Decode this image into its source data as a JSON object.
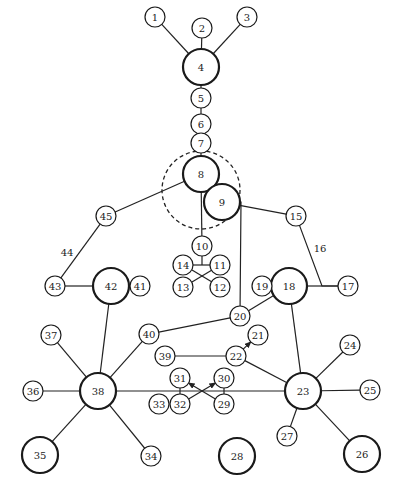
{
  "diagram": {
    "type": "network-graph",
    "colors": {
      "stroke": "#1a1a1a",
      "fill": "#ffffff",
      "text": "#222222"
    },
    "nodes": [
      {
        "id": "1",
        "x": 155,
        "y": 17,
        "r": 10,
        "w": 1.2
      },
      {
        "id": "2",
        "x": 202,
        "y": 28,
        "r": 10,
        "w": 1.2
      },
      {
        "id": "3",
        "x": 247,
        "y": 17,
        "r": 10,
        "w": 1.2
      },
      {
        "id": "4",
        "x": 201,
        "y": 67,
        "r": 18,
        "w": 2.2
      },
      {
        "id": "5",
        "x": 201,
        "y": 98,
        "r": 10,
        "w": 1.2
      },
      {
        "id": "6",
        "x": 201,
        "y": 124,
        "r": 10,
        "w": 1.2
      },
      {
        "id": "7",
        "x": 201,
        "y": 143,
        "r": 10,
        "w": 1.2
      },
      {
        "id": "8",
        "x": 201,
        "y": 174,
        "r": 18,
        "w": 2.2
      },
      {
        "id": "9",
        "x": 222,
        "y": 202,
        "r": 18,
        "w": 2.2
      },
      {
        "id": "10",
        "x": 202,
        "y": 246,
        "r": 10,
        "w": 1.2
      },
      {
        "id": "11",
        "x": 220,
        "y": 265,
        "r": 10,
        "w": 1.2
      },
      {
        "id": "12",
        "x": 220,
        "y": 287,
        "r": 10,
        "w": 1.2
      },
      {
        "id": "13",
        "x": 183,
        "y": 287,
        "r": 10,
        "w": 1.2
      },
      {
        "id": "14",
        "x": 183,
        "y": 265,
        "r": 10,
        "w": 1.2
      },
      {
        "id": "15",
        "x": 296,
        "y": 216,
        "r": 10,
        "w": 1.2
      },
      {
        "id": "17",
        "x": 348,
        "y": 286,
        "r": 10,
        "w": 1.2
      },
      {
        "id": "18",
        "x": 289,
        "y": 286,
        "r": 18,
        "w": 2.2
      },
      {
        "id": "19",
        "x": 262,
        "y": 286,
        "r": 10,
        "w": 1.2
      },
      {
        "id": "20",
        "x": 240,
        "y": 316,
        "r": 10,
        "w": 1.2
      },
      {
        "id": "21",
        "x": 258,
        "y": 335,
        "r": 10,
        "w": 1.2
      },
      {
        "id": "22",
        "x": 236,
        "y": 356,
        "r": 10,
        "w": 1.2
      },
      {
        "id": "23",
        "x": 303,
        "y": 391,
        "r": 18,
        "w": 2.2
      },
      {
        "id": "24",
        "x": 350,
        "y": 345,
        "r": 10,
        "w": 1.2
      },
      {
        "id": "25",
        "x": 370,
        "y": 390,
        "r": 10,
        "w": 1.2
      },
      {
        "id": "26",
        "x": 362,
        "y": 454,
        "r": 18,
        "w": 2.2
      },
      {
        "id": "27",
        "x": 287,
        "y": 436,
        "r": 10,
        "w": 1.2
      },
      {
        "id": "28",
        "x": 237,
        "y": 456,
        "r": 18,
        "w": 2.2
      },
      {
        "id": "29",
        "x": 224,
        "y": 404,
        "r": 10,
        "w": 1.2
      },
      {
        "id": "30",
        "x": 224,
        "y": 378,
        "r": 10,
        "w": 1.2
      },
      {
        "id": "31",
        "x": 180,
        "y": 378,
        "r": 10,
        "w": 1.2
      },
      {
        "id": "32",
        "x": 180,
        "y": 404,
        "r": 10,
        "w": 1.2
      },
      {
        "id": "33",
        "x": 159,
        "y": 404,
        "r": 10,
        "w": 1.2
      },
      {
        "id": "34",
        "x": 151,
        "y": 456,
        "r": 10,
        "w": 1.2
      },
      {
        "id": "35",
        "x": 40,
        "y": 455,
        "r": 18,
        "w": 2.2
      },
      {
        "id": "36",
        "x": 33,
        "y": 391,
        "r": 10,
        "w": 1.2
      },
      {
        "id": "37",
        "x": 51,
        "y": 335,
        "r": 10,
        "w": 1.2
      },
      {
        "id": "38",
        "x": 98,
        "y": 391,
        "r": 18,
        "w": 2.2
      },
      {
        "id": "39",
        "x": 165,
        "y": 356,
        "r": 10,
        "w": 1.2
      },
      {
        "id": "40",
        "x": 149,
        "y": 334,
        "r": 10,
        "w": 1.2
      },
      {
        "id": "41",
        "x": 140,
        "y": 286,
        "r": 10,
        "w": 1.2
      },
      {
        "id": "42",
        "x": 111,
        "y": 286,
        "r": 18,
        "w": 2.2
      },
      {
        "id": "43",
        "x": 55,
        "y": 286,
        "r": 10,
        "w": 1.2
      },
      {
        "id": "45",
        "x": 106,
        "y": 216,
        "r": 10,
        "w": 1.2
      }
    ],
    "edges": [
      {
        "from": "1",
        "to": "4"
      },
      {
        "from": "2",
        "to": "4"
      },
      {
        "from": "3",
        "to": "4"
      },
      {
        "from": "4",
        "to": "5"
      },
      {
        "from": "5",
        "to": "6"
      },
      {
        "from": "6",
        "to": "7"
      },
      {
        "from": "7",
        "to": "8"
      },
      {
        "from": "8",
        "to": "45"
      },
      {
        "from": "9",
        "to": "15"
      },
      {
        "from": "8",
        "to": "10"
      },
      {
        "from": "15",
        "to": "17",
        "via": [
          322,
          286
        ]
      },
      {
        "from": "18",
        "to": "17"
      },
      {
        "from": "18",
        "to": "23"
      },
      {
        "from": "18",
        "to": "20"
      },
      {
        "from": "9",
        "to": "20",
        "via": [
          241,
          202
        ]
      },
      {
        "from": "20",
        "to": "40"
      },
      {
        "from": "40",
        "to": "38"
      },
      {
        "from": "39",
        "to": "22"
      },
      {
        "from": "22",
        "to": "21",
        "arrow": true
      },
      {
        "from": "22",
        "to": "23"
      },
      {
        "from": "23",
        "to": "24"
      },
      {
        "from": "23",
        "to": "25"
      },
      {
        "from": "23",
        "to": "26"
      },
      {
        "from": "23",
        "to": "27"
      },
      {
        "from": "38",
        "to": "23"
      },
      {
        "from": "38",
        "to": "37"
      },
      {
        "from": "38",
        "to": "36"
      },
      {
        "from": "38",
        "to": "35"
      },
      {
        "from": "38",
        "to": "34"
      },
      {
        "from": "38",
        "to": "42"
      },
      {
        "from": "42",
        "to": "43"
      },
      {
        "from": "43",
        "to": "45"
      },
      {
        "from": "32",
        "to": "30",
        "arrow": true
      },
      {
        "from": "29",
        "to": "31",
        "arrow": true
      },
      {
        "from": "32",
        "to": "31"
      },
      {
        "from": "29",
        "to": "30"
      }
    ],
    "special_lines": [
      {
        "name": "connector-10-hub",
        "x1": 202,
        "y1": 256,
        "x2": 202,
        "y2": 265
      },
      {
        "name": "connector-14-11",
        "x1": 193,
        "y1": 265,
        "x2": 210,
        "y2": 265
      },
      {
        "name": "cross-14-12",
        "x1": 192,
        "y1": 270,
        "x2": 212,
        "y2": 282
      },
      {
        "name": "cross-11-13",
        "x1": 212,
        "y1": 270,
        "x2": 192,
        "y2": 282
      }
    ],
    "edge_labels": [
      {
        "text": "44",
        "x": 67,
        "y": 252
      },
      {
        "text": "16",
        "x": 320,
        "y": 248
      }
    ],
    "dashed_circle": {
      "cx": 201,
      "cy": 190,
      "r": 39
    }
  }
}
